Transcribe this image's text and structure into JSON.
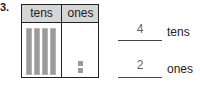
{
  "problem": {
    "number": "3.",
    "table": {
      "headers": [
        "tens",
        "ones"
      ],
      "tens_rods": 4,
      "ones_units": 2
    },
    "answers": [
      {
        "value": "4",
        "label": "tens"
      },
      {
        "value": "2",
        "label": "ones"
      }
    ]
  }
}
